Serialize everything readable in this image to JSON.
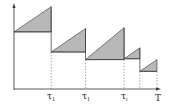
{
  "diagram": {
    "colors": {
      "fill": "#b8b8b8",
      "stroke": "#333333",
      "dashed": "#666666"
    },
    "axis": {
      "x_label": "T"
    },
    "event_labels": [
      {
        "symbol": "τ",
        "subscript": "1"
      },
      {
        "symbol": "τ",
        "subscript": "1"
      },
      {
        "symbol": "τ",
        "subscript": "i"
      }
    ],
    "segments": [
      {
        "start": 0.0,
        "end": 0.26,
        "base": 0.68,
        "peak": 0.98
      },
      {
        "start": 0.26,
        "end": 0.5,
        "base": 0.44,
        "peak": 0.72
      },
      {
        "start": 0.5,
        "end": 0.77,
        "base": 0.35,
        "peak": 0.73
      },
      {
        "start": 0.77,
        "end": 0.88,
        "base": 0.36,
        "peak": 0.49
      },
      {
        "start": 0.88,
        "end": 1.0,
        "base": 0.21,
        "peak": 0.35
      }
    ]
  }
}
